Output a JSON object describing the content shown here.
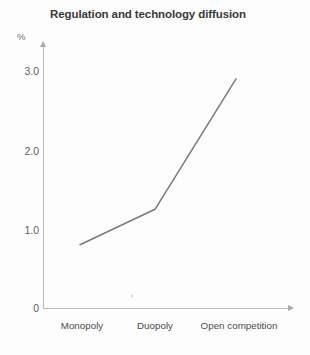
{
  "chart_data": {
    "type": "line",
    "title": "Regulation and technology diffusion",
    "xlabel": "",
    "ylabel": "%",
    "categories": [
      "Monopoly",
      "Duopoly",
      "Open competition"
    ],
    "values": [
      0.8,
      1.25,
      2.9
    ],
    "series": [
      {
        "name": "Technology diffusion",
        "values": [
          0.8,
          1.25,
          2.9
        ]
      }
    ],
    "ylim": [
      0,
      3.2
    ],
    "y_ticks": [
      "0",
      "1.0",
      "2.0",
      "3.0"
    ],
    "y_tick_values": [
      0,
      1.0,
      2.0,
      3.0
    ],
    "grid": false,
    "legend": false,
    "legend_position": "none",
    "line_color": "#7a7a7a",
    "axis_color": "#b9b9b9",
    "title_color": "#3a3a3a"
  },
  "axes": {
    "y": {
      "unit_label": "%",
      "ticks": [
        {
          "label": "3.0",
          "value": 3.0
        },
        {
          "label": "2.0",
          "value": 2.0
        },
        {
          "label": "1.0",
          "value": 1.0
        },
        {
          "label": "0",
          "value": 0
        }
      ]
    },
    "x": {
      "ticks": [
        {
          "label": "Monopoly"
        },
        {
          "label": "Duopoly"
        },
        {
          "label": "Open competition"
        }
      ]
    }
  }
}
